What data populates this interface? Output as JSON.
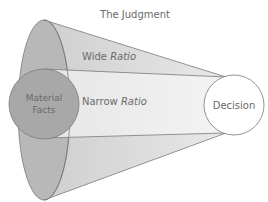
{
  "diagram": {
    "title": "The Judgment",
    "wide_ratio": {
      "prefix": "Wide ",
      "italic": "Ratio"
    },
    "narrow_ratio": {
      "prefix": "Narrow ",
      "italic": "Ratio"
    },
    "material_facts": {
      "line1": "Material",
      "line2": "Facts"
    },
    "decision": "Decision",
    "colors": {
      "outer_ellipse": "#b4b4b4",
      "wide_cone": "#d8d8d8",
      "narrow_cone": "#ebebeb",
      "material_facts": "#a6a6a6",
      "decision_fill": "#ffffff",
      "stroke": "#7a7a7a",
      "text": "#6a6a6a"
    }
  }
}
